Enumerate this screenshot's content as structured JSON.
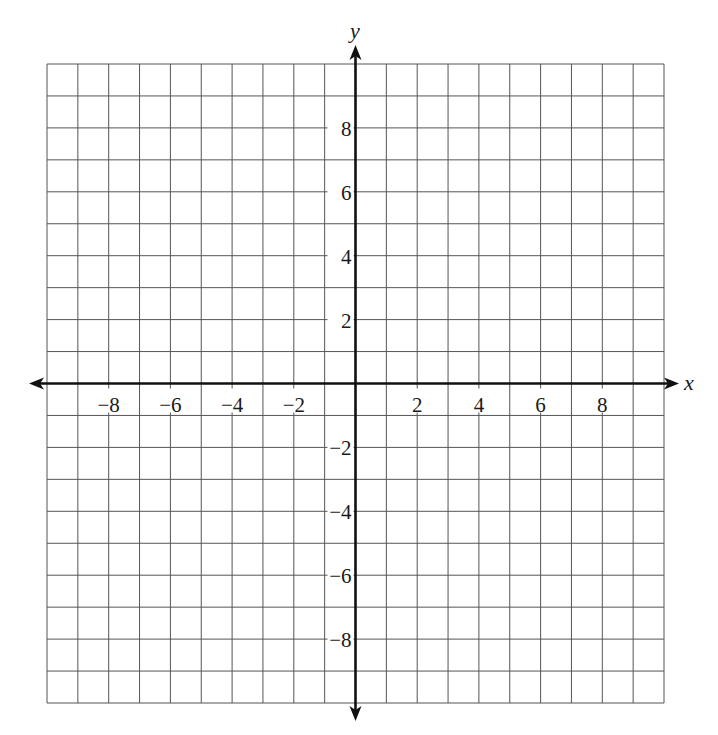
{
  "chart_data": {
    "type": "coordinate_grid",
    "title": "",
    "xlabel": "x",
    "ylabel": "y",
    "xlim": [
      -10,
      10
    ],
    "ylim": [
      -10,
      10
    ],
    "grid": true,
    "grid_step": 1,
    "x_ticks": [
      -8,
      -6,
      -4,
      -2,
      2,
      4,
      6,
      8
    ],
    "y_ticks": [
      8,
      6,
      4,
      2,
      -2,
      -4,
      -6,
      -8
    ],
    "x_tick_labels": [
      "−8",
      "−6",
      "−4",
      "−2",
      "2",
      "4",
      "6",
      "8"
    ],
    "y_tick_labels": [
      "8",
      "6",
      "4",
      "2",
      "−2",
      "−4",
      "−6",
      "−8"
    ],
    "series": [],
    "legend": null
  },
  "colors": {
    "grid": "#555555",
    "axis": "#111111",
    "text": "#1a1a1a"
  },
  "layout": {
    "grid_left": 47,
    "grid_top": 64,
    "grid_right": 664,
    "grid_bottom": 703
  }
}
